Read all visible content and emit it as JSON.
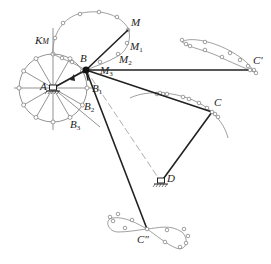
{
  "diagram": {
    "type": "four-bar linkage with coupler curves",
    "labels": {
      "A": "A",
      "B": "B",
      "B1": "B1",
      "B2": "B2",
      "B3": "B3",
      "C": "C",
      "C_prime": "C'",
      "C_double_prime": "C\"",
      "D": "D",
      "M": "M",
      "M1": "M1",
      "M2": "M2",
      "M3": "M3",
      "KM": "KM"
    },
    "joints": {
      "A": [
        53,
        88
      ],
      "B": [
        86,
        70
      ],
      "C": [
        212,
        112
      ],
      "D": [
        161,
        182
      ],
      "M": [
        128,
        30
      ],
      "M3": [
        86,
        70
      ],
      "C_prime": [
        250,
        70
      ],
      "C_double_prime": [
        147,
        229
      ]
    },
    "crank_circle": {
      "center": [
        53,
        88
      ],
      "radius": 34,
      "divisions": 12
    },
    "colors": {
      "link": "#222222",
      "construction": "#777777",
      "curve": "#888888"
    }
  }
}
